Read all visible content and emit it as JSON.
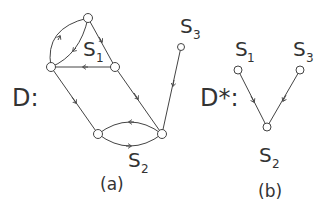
{
  "diagram_a": {
    "graph_label": "D:",
    "caption": "(a)",
    "labels": {
      "s1": "S",
      "s1_sub": "1",
      "s2": "S",
      "s2_sub": "2",
      "s3": "S",
      "s3_sub": "3"
    },
    "nodes": [
      {
        "id": "top",
        "x": 88,
        "y": 18
      },
      {
        "id": "left",
        "x": 51,
        "y": 67
      },
      {
        "id": "mid",
        "x": 115,
        "y": 67
      },
      {
        "id": "botL",
        "x": 98,
        "y": 134
      },
      {
        "id": "botR",
        "x": 162,
        "y": 134
      },
      {
        "id": "s3",
        "x": 181,
        "y": 47
      }
    ],
    "edges": [
      {
        "from": "left",
        "to": "top",
        "curved": true
      },
      {
        "from": "top",
        "to": "left",
        "curved": true
      },
      {
        "from": "top",
        "to": "mid"
      },
      {
        "from": "mid",
        "to": "left"
      },
      {
        "from": "left",
        "to": "botL"
      },
      {
        "from": "mid",
        "to": "botR"
      },
      {
        "from": "botR",
        "to": "botL",
        "curved": true
      },
      {
        "from": "botL",
        "to": "botR",
        "curved": true
      },
      {
        "from": "s3",
        "to": "botR"
      }
    ]
  },
  "diagram_b": {
    "graph_label": "D*:",
    "caption": "(b)",
    "labels": {
      "s1": "S",
      "s1_sub": "1",
      "s2": "S",
      "s2_sub": "2",
      "s3": "S",
      "s3_sub": "3"
    },
    "nodes": [
      {
        "id": "S1",
        "x": 238,
        "y": 70
      },
      {
        "id": "S3",
        "x": 300,
        "y": 70
      },
      {
        "id": "S2",
        "x": 267,
        "y": 127
      }
    ],
    "edges": [
      {
        "from": "S1",
        "to": "S2"
      },
      {
        "from": "S3",
        "to": "S2"
      }
    ]
  }
}
